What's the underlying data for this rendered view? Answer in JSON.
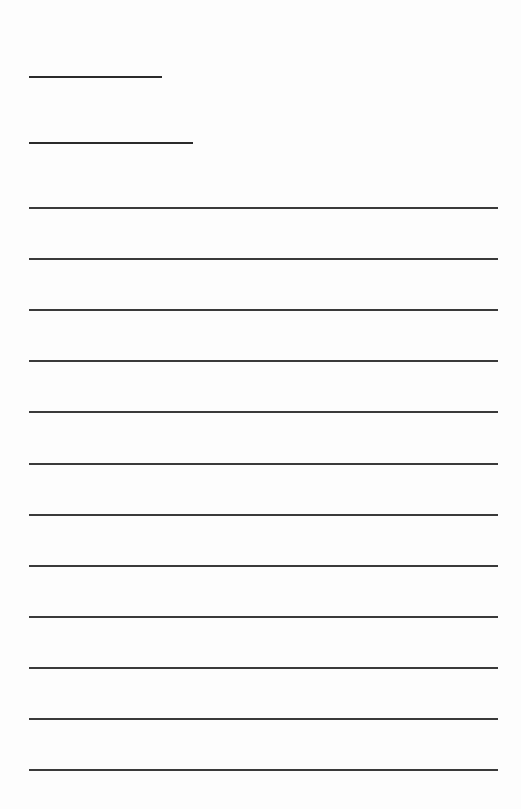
{
  "page": {
    "background": "#fdfdfd",
    "line_color": "#2a2a2a"
  },
  "header_fields": [
    {
      "name": "short-field-1",
      "x": 29,
      "y": 76,
      "width": 133
    },
    {
      "name": "short-field-2",
      "x": 29,
      "y": 142,
      "width": 164
    }
  ],
  "writing_lines": {
    "count": 12,
    "x": 29,
    "width": 469,
    "first_y": 207,
    "spacing": 51.1
  }
}
